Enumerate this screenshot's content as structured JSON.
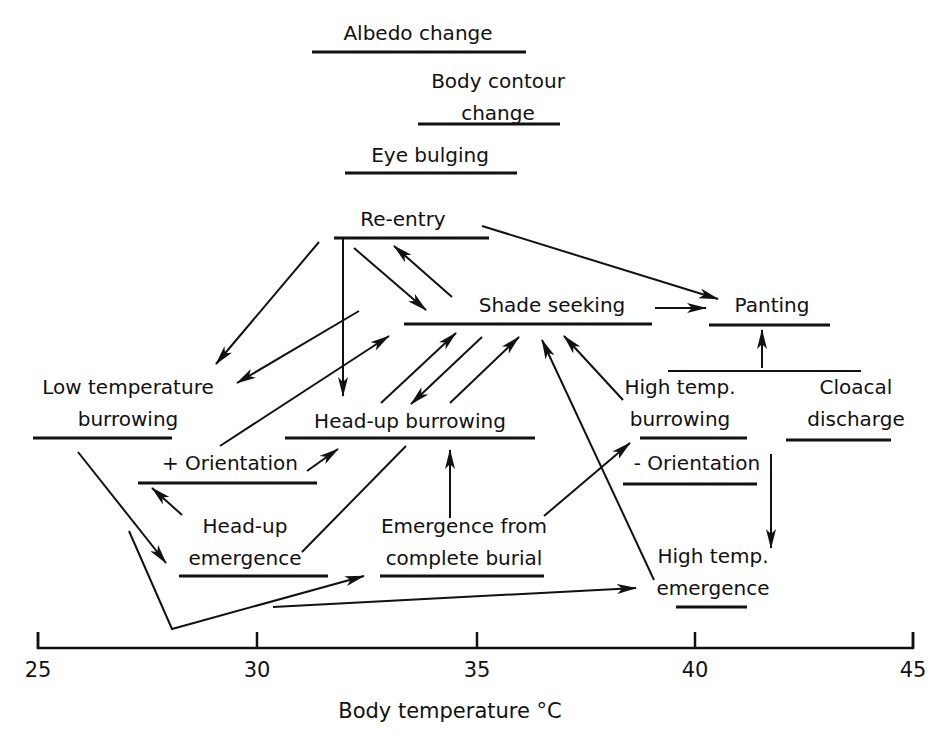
{
  "figure": {
    "colors": {
      "ink": "#111111",
      "background": "#ffffff"
    },
    "x_axis": {
      "label": "Body temperature °C",
      "min": 25,
      "max": 45,
      "ticks": [
        {
          "value": 25,
          "label": "25",
          "x": 38
        },
        {
          "value": 30,
          "label": "30",
          "x": 257
        },
        {
          "value": 35,
          "label": "35",
          "x": 477
        },
        {
          "value": 40,
          "label": "40",
          "x": 695
        },
        {
          "value": 45,
          "label": "45",
          "x": 913
        }
      ]
    },
    "behaviours": [
      {
        "id": "albedo",
        "lines": [
          "Albedo change"
        ],
        "text_x": 418,
        "text_y": 40,
        "bar": [
          312,
          526,
          52
        ]
      },
      {
        "id": "body-contour",
        "lines": [
          "Body contour",
          "change"
        ],
        "text_x": 498,
        "text_y": 88,
        "bar": [
          418,
          560,
          124
        ]
      },
      {
        "id": "eye-bulging",
        "lines": [
          "Eye bulging"
        ],
        "text_x": 430,
        "text_y": 162,
        "bar": [
          345,
          517,
          173
        ]
      },
      {
        "id": "re-entry",
        "lines": [
          "Re-entry"
        ],
        "text_x": 403,
        "text_y": 226,
        "bar": [
          334,
          489,
          238
        ]
      },
      {
        "id": "shade-seeking",
        "lines": [
          "Shade seeking"
        ],
        "text_x": 552,
        "text_y": 312,
        "bar": [
          404,
          652,
          324
        ]
      },
      {
        "id": "panting",
        "lines": [
          "Panting"
        ],
        "text_x": 772,
        "text_y": 312,
        "bar": [
          709,
          830,
          325
        ]
      },
      {
        "id": "low-temp-burrowing",
        "lines": [
          "Low temperature",
          "burrowing"
        ],
        "text_x": 128,
        "text_y": 394,
        "bar": [
          33,
          172,
          438
        ]
      },
      {
        "id": "head-up-burrowing",
        "lines": [
          "Head-up burrowing"
        ],
        "text_x": 410,
        "text_y": 428,
        "bar": [
          285,
          535,
          438
        ]
      },
      {
        "id": "high-temp-burrowing",
        "lines": [
          "High temp.",
          "burrowing"
        ],
        "text_x": 680,
        "text_y": 394,
        "bar": [
          640,
          747,
          438
        ]
      },
      {
        "id": "cloacal-discharge",
        "lines": [
          "Cloacal",
          "discharge"
        ],
        "text_x": 856,
        "text_y": 394,
        "bar": [
          786,
          891,
          440
        ]
      },
      {
        "id": "plus-orientation",
        "lines": [
          "+ Orientation"
        ],
        "text_x": 230,
        "text_y": 470,
        "bar": [
          138,
          317,
          483
        ]
      },
      {
        "id": "minus-orientation",
        "lines": [
          "- Orientation"
        ],
        "text_x": 697,
        "text_y": 470,
        "bar": [
          623,
          757,
          484
        ]
      },
      {
        "id": "head-up-emergence",
        "lines": [
          "Head-up",
          "emergence"
        ],
        "text_x": 245,
        "text_y": 533,
        "bar": [
          179,
          328,
          576
        ]
      },
      {
        "id": "emergence-complete-burial",
        "lines": [
          "Emergence from",
          "complete burial"
        ],
        "text_x": 464,
        "text_y": 533,
        "bar": [
          380,
          544,
          576
        ]
      },
      {
        "id": "high-temp-emergence",
        "lines": [
          "High temp.",
          "emergence"
        ],
        "text_x": 713,
        "text_y": 563,
        "bar": [
          676,
          747,
          607
        ]
      }
    ],
    "joint_bar": {
      "label": "panting-cloacal-joint",
      "bar": [
        668,
        861,
        371
      ]
    },
    "arrows": [
      {
        "name": "reentry-to-low-temp-burrowing",
        "pts": [
          [
            319,
            242
          ],
          [
            216,
            364
          ]
        ],
        "head": "end"
      },
      {
        "name": "reentry-to-head-up-burrowing",
        "pts": [
          [
            343,
            238
          ],
          [
            343,
            396
          ]
        ],
        "head": "end"
      },
      {
        "name": "reentry-to-shade-seeking",
        "pts": [
          [
            354,
            248
          ],
          [
            426,
            310
          ]
        ],
        "head": "end"
      },
      {
        "name": "shade-seeking-to-reentry",
        "pts": [
          [
            452,
            297
          ],
          [
            394,
            246
          ]
        ],
        "head": "end"
      },
      {
        "name": "reentry-to-panting",
        "pts": [
          [
            482,
            226
          ],
          [
            718,
            299
          ]
        ],
        "head": "end"
      },
      {
        "name": "shade-seeking-to-panting",
        "pts": [
          [
            655,
            308
          ],
          [
            706,
            308
          ]
        ],
        "head": "end"
      },
      {
        "name": "shade-seeking-to-low-temp-burrowing",
        "pts": [
          [
            359,
            311
          ],
          [
            237,
            383
          ]
        ],
        "head": "end"
      },
      {
        "name": "plus-orientation-to-shade-seeking",
        "pts": [
          [
            220,
            446
          ],
          [
            389,
            336
          ]
        ],
        "head": "end"
      },
      {
        "name": "head-up-burrowing-to-shade-seeking",
        "pts": [
          [
            381,
            403
          ],
          [
            456,
            333
          ]
        ],
        "head": "end"
      },
      {
        "name": "shade-seeking-to-head-up-burrowing",
        "pts": [
          [
            482,
            337
          ],
          [
            411,
            404
          ]
        ],
        "head": "end"
      },
      {
        "name": "head-up-burrowing-to-shade-seeking-2",
        "pts": [
          [
            450,
            403
          ],
          [
            519,
            337
          ]
        ],
        "head": "end"
      },
      {
        "name": "high-temp-emergence-to-shade-seeking",
        "pts": [
          [
            654,
            580
          ],
          [
            542,
            340
          ]
        ],
        "head": "end"
      },
      {
        "name": "high-temp-burrowing-to-shade-seeking",
        "pts": [
          [
            623,
            400
          ],
          [
            564,
            336
          ]
        ],
        "head": "end"
      },
      {
        "name": "joint-to-panting",
        "pts": [
          [
            762,
            368
          ],
          [
            762,
            330
          ]
        ],
        "head": "end"
      },
      {
        "name": "plus-orientation-to-head-up-burrowing",
        "pts": [
          [
            307,
            471
          ],
          [
            338,
            449
          ]
        ],
        "head": "end"
      },
      {
        "name": "head-up-emergence-to-plus-orientation",
        "pts": [
          [
            182,
            515
          ],
          [
            152,
            488
          ]
        ],
        "head": "end"
      },
      {
        "name": "head-up-emergence-to-head-up-burrowing",
        "pts": [
          [
            302,
            552
          ],
          [
            406,
            446
          ]
        ],
        "head": "none"
      },
      {
        "name": "emergence-burial-to-head-up-burrowing",
        "pts": [
          [
            450,
            518
          ],
          [
            450,
            450
          ]
        ],
        "head": "end"
      },
      {
        "name": "emergence-burial-to-minus-orientation",
        "pts": [
          [
            544,
            516
          ],
          [
            630,
            443
          ]
        ],
        "head": "end"
      },
      {
        "name": "minus-orientation-to-high-temp-emergence",
        "pts": [
          [
            771,
            454
          ],
          [
            771,
            548
          ]
        ],
        "head": "end"
      },
      {
        "name": "low-temp-burrowing-to-head-up-emergence",
        "pts": [
          [
            78,
            452
          ],
          [
            166,
            563
          ]
        ],
        "head": "end"
      },
      {
        "name": "v-path-to-emergence-complete-burial",
        "pts": [
          [
            129,
            531
          ],
          [
            172,
            629
          ],
          [
            364,
            576
          ]
        ],
        "head": "end"
      },
      {
        "name": "to-high-temp-emergence",
        "pts": [
          [
            273,
            607
          ],
          [
            636,
            588
          ]
        ],
        "head": "end"
      }
    ]
  }
}
